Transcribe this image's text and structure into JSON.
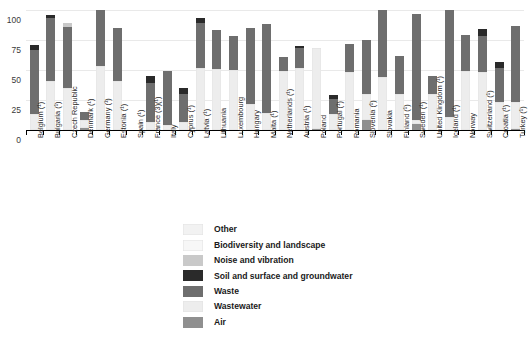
{
  "chart_data": {
    "type": "bar",
    "title": "",
    "xlabel": "",
    "ylabel": "",
    "ylim": [
      0,
      100
    ],
    "yticks": [
      0,
      25,
      50,
      75,
      100
    ],
    "grid": true,
    "stacked": true,
    "legend_position": "bottom",
    "legend": [
      {
        "label": "Other",
        "color": "#f2f2f2"
      },
      {
        "label": "Biodiversity and landscape",
        "color": "#f7f7f7"
      },
      {
        "label": "Noise and vibration",
        "color": "#c9c9c9"
      },
      {
        "label": "Soil and surface and groundwater",
        "color": "#2a2a2a"
      },
      {
        "label": "Waste",
        "color": "#6e6e6e"
      },
      {
        "label": "Wastewater",
        "color": "#ededed"
      },
      {
        "label": "Air",
        "color": "#8f8f8f"
      }
    ],
    "series": [
      {
        "name": "Air",
        "color": "#8f8f8f",
        "values": [
          0,
          0,
          0,
          1.5,
          0,
          0,
          0,
          0,
          0,
          0,
          0,
          0,
          0,
          0,
          0,
          0,
          0,
          0.5,
          0,
          0,
          8,
          0,
          0,
          5,
          0,
          0,
          0,
          0,
          0,
          0.5
        ]
      },
      {
        "name": "Wastewater",
        "color": "#ededed",
        "values": [
          13,
          41,
          35,
          6.5,
          53,
          41,
          0,
          7,
          4,
          7,
          52,
          51,
          50,
          22,
          14,
          49,
          52,
          68,
          13,
          48,
          22,
          44,
          30,
          3,
          30,
          11,
          49,
          48,
          23,
          23
        ]
      },
      {
        "name": "Waste",
        "color": "#6e6e6e",
        "values": [
          54,
          52,
          51,
          7,
          47,
          44,
          0,
          32,
          45,
          23,
          37,
          32,
          28,
          63,
          74,
          12,
          16,
          0,
          13,
          24,
          45,
          56,
          32,
          89,
          15,
          89,
          30,
          30,
          29,
          63
        ]
      },
      {
        "name": "Soil and surface and groundwater",
        "color": "#2a2a2a",
        "values": [
          4,
          3,
          0,
          0,
          0,
          0,
          0,
          6,
          0,
          5,
          4,
          0,
          0,
          0,
          0,
          0,
          2,
          0,
          3,
          0,
          0,
          0,
          0,
          0,
          0,
          0,
          0,
          6,
          5,
          0
        ]
      },
      {
        "name": "Noise and vibration",
        "color": "#c9c9c9",
        "values": [
          0,
          0,
          3,
          0,
          0,
          0,
          0,
          0,
          0,
          0,
          0,
          0,
          0,
          0,
          0,
          0,
          0,
          0,
          0,
          0,
          0,
          0,
          0,
          0,
          0,
          0,
          0,
          0,
          0,
          0
        ]
      },
      {
        "name": "Biodiversity and landscape",
        "color": "#f7f7f7",
        "values": [
          0,
          0,
          0,
          0,
          0,
          0,
          0,
          0,
          0,
          0,
          0,
          0,
          0,
          0,
          0,
          0,
          0,
          0,
          0,
          0,
          0,
          0,
          0,
          0,
          0,
          0,
          0,
          0,
          0,
          0
        ]
      },
      {
        "name": "Other",
        "color": "#f2f2f2",
        "values": [
          0,
          0,
          0,
          0,
          0,
          0,
          0,
          0,
          0,
          0,
          0,
          0,
          0,
          0,
          0,
          0,
          0,
          0,
          0,
          0,
          0,
          0,
          0,
          0,
          0,
          0,
          0,
          0,
          0,
          0
        ]
      }
    ],
    "categories": [
      "Belgium (¹)",
      "Bulgaria (¹)",
      "Czech Republic",
      "Denmark (¹)",
      "Germany (¹)",
      "Estonia (¹)",
      "Spain (¹)",
      "France (3)(¹)",
      "Italy",
      "Cyprus (¹)",
      "Latvia (¹)",
      "Lithuania",
      "Luxembourg",
      "Hungary",
      "Malta (¹)",
      "Netherlands (¹)",
      "Austria (¹)",
      "Poland",
      "Portugal (¹)",
      "Romania",
      "Slovenia (¹)",
      "Slovakia",
      "Finland (¹)",
      "Sweden (¹)",
      "United Kingdom (¹)",
      "Iceland (¹)",
      "Norway",
      "Switzerland (¹)",
      "Croatia (¹)",
      "Turkey (¹)"
    ]
  }
}
